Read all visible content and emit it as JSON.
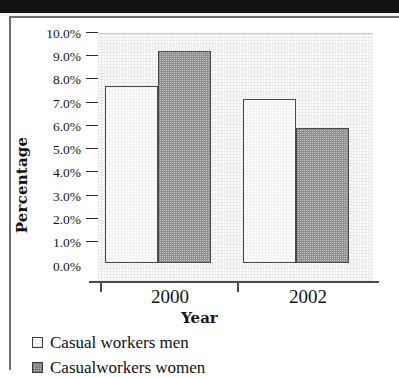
{
  "chart_data": {
    "type": "bar",
    "title": "",
    "xlabel": "Year",
    "ylabel": "Percentage",
    "categories": [
      "2000",
      "2002"
    ],
    "series": [
      {
        "name": "Casual workers men",
        "values": [
          7.7,
          7.15
        ],
        "swatch": "light-checkered"
      },
      {
        "name": "Casualworkers women",
        "values": [
          9.2,
          5.85
        ],
        "swatch": "dark-checkered"
      }
    ],
    "ylim": [
      0,
      10
    ],
    "ytick_labels": [
      "10.0%",
      "9.0%",
      "8.0%",
      "7.0%",
      "6.0%",
      "5.0%",
      "4.0%",
      "3.0%",
      "2.0%",
      "1.0%",
      "0.0%"
    ],
    "ytick_values": [
      10,
      9,
      8,
      7,
      6,
      5,
      4,
      3,
      2,
      1,
      0
    ],
    "grid": false,
    "legend_position": "below-left",
    "colors": {
      "men_fill": "#fdfdfd",
      "women_fill": "#c3c3c3",
      "bar_border": "#4a4a4a",
      "axis": "#4a4a4a",
      "text": "#141414",
      "plot_background": "#fbfbfb"
    }
  },
  "axis": {
    "y_title": "Percentage",
    "x_title": "Year"
  },
  "ytick_labels": [
    "10.0%",
    "9.0%",
    "8.0%",
    "7.0%",
    "6.0%",
    "5.0%",
    "4.0%",
    "3.0%",
    "2.0%",
    "1.0%",
    "0.0%"
  ],
  "xtick_labels": [
    "2000",
    "2002"
  ],
  "legend": {
    "items": [
      {
        "label": "Casual workers men"
      },
      {
        "label": "Casualworkers women"
      }
    ]
  }
}
